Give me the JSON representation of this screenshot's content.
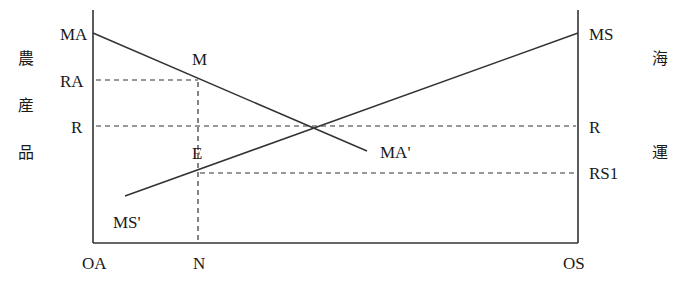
{
  "diagram": {
    "type": "two-sector allocation diagram",
    "left_axis_title": [
      "農",
      "産",
      "品"
    ],
    "right_axis_title": [
      "海",
      "運"
    ],
    "left_labels": {
      "top": "MA",
      "upper": "RA",
      "mid": "R"
    },
    "right_labels": {
      "top": "MS",
      "mid": "R",
      "lower": "RS1"
    },
    "curve_labels": {
      "ma_start": "MA",
      "ma_end": "MA'",
      "ms_start": "MS'",
      "ms_end": "MS"
    },
    "points": {
      "m": "M",
      "e": "E"
    },
    "bottom_labels": {
      "left": "OA",
      "mid": "N",
      "right": "OS"
    },
    "line_color": "#333333",
    "lines": [
      {
        "name": "MA-MA'",
        "from": "MA (left axis top)",
        "to": "MA'",
        "style": "solid"
      },
      {
        "name": "MS'-MS",
        "from": "MS'",
        "to": "MS (right axis top)",
        "style": "solid"
      },
      {
        "name": "RA level",
        "from": "left axis",
        "to": "M",
        "style": "dashed"
      },
      {
        "name": "R level",
        "from": "left axis",
        "to": "right axis",
        "style": "dashed"
      },
      {
        "name": "RS1 level",
        "from": "E",
        "to": "right axis",
        "style": "dashed"
      },
      {
        "name": "N vertical",
        "from": "M",
        "to": "N",
        "style": "dashed"
      }
    ]
  }
}
